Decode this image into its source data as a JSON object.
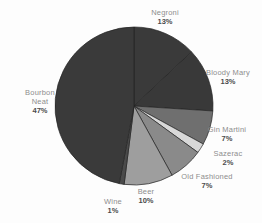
{
  "chart_data": {
    "type": "pie",
    "title": "",
    "legend": "none",
    "direction": "clockwise",
    "start_angle_deg": 0,
    "slices": [
      {
        "label": "Negroni",
        "value": 13,
        "pct": "13%",
        "color": "#3a3a3a"
      },
      {
        "label": "Bloody Mary",
        "value": 13,
        "pct": "13%",
        "color": "#393939"
      },
      {
        "label": "Gin Martini",
        "value": 7,
        "pct": "7%",
        "color": "#6f6f6f"
      },
      {
        "label": "Sazerac",
        "value": 2,
        "pct": "2%",
        "color": "#d8d8d8"
      },
      {
        "label": "Old Fashioned",
        "value": 7,
        "pct": "7%",
        "color": "#8a8a8a"
      },
      {
        "label": "Beer",
        "value": 10,
        "pct": "10%",
        "color": "#9e9e9e"
      },
      {
        "label": "Wine",
        "value": 1,
        "pct": "1%",
        "color": "#4a4a4a"
      },
      {
        "label": "Bourbon Neat",
        "value": 47,
        "pct": "47%",
        "color": "#3a3a3a"
      }
    ],
    "colors": {
      "label_name": "#8d8d8d",
      "label_pct": "#4b4b4b",
      "slice_border": "#242424",
      "background": "#fdfdfd"
    }
  }
}
